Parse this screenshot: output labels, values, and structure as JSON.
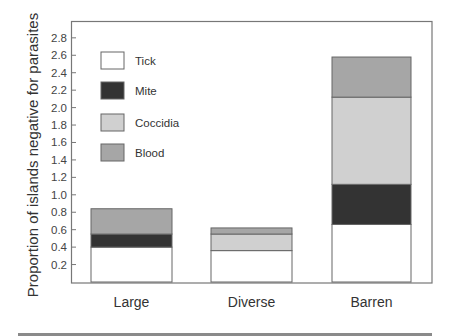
{
  "chart_data": {
    "type": "bar",
    "stacked": true,
    "title": "",
    "xlabel": "",
    "ylabel": "Proportion of islands negative for parasites",
    "categories": [
      "Large",
      "Diverse",
      "Barren"
    ],
    "series": [
      {
        "name": "Tick",
        "color": "#ffffff",
        "values": [
          0.4,
          0.36,
          0.66
        ]
      },
      {
        "name": "Mite",
        "color": "#333333",
        "values": [
          0.15,
          0.0,
          0.46
        ]
      },
      {
        "name": "Coccidia",
        "color": "#d0d0d0",
        "values": [
          0.0,
          0.19,
          1.0
        ]
      },
      {
        "name": "Blood",
        "color": "#a6a6a6",
        "values": [
          0.29,
          0.07,
          0.46
        ]
      }
    ],
    "totals": [
      0.84,
      0.62,
      2.58
    ],
    "ylim": [
      0,
      2.9
    ],
    "yticks": [
      "0.2",
      "0.4",
      "0.6",
      "0.8",
      "1.0",
      "1.2",
      "1.4",
      "1.6",
      "1.8",
      "2.0",
      "2.2",
      "2.4",
      "2.6",
      "2.8"
    ],
    "grid": false,
    "legend_position": "upper-left-inside"
  },
  "legend": {
    "items": [
      {
        "label": "Tick",
        "color": "#ffffff"
      },
      {
        "label": "Mite",
        "color": "#333333"
      },
      {
        "label": "Coccidia",
        "color": "#d0d0d0"
      },
      {
        "label": "Blood",
        "color": "#a6a6a6"
      }
    ]
  }
}
